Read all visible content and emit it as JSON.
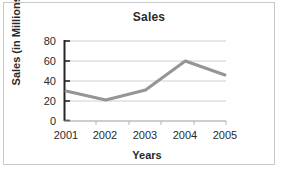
{
  "chart_data": {
    "type": "line",
    "title": "Sales",
    "xlabel": "Years",
    "ylabel": "Sales (in Millions)",
    "categories": [
      "2001",
      "2002",
      "2003",
      "2004",
      "2005"
    ],
    "values": [
      30,
      21,
      31,
      60,
      46
    ],
    "series": [
      {
        "name": "Sales",
        "values": [
          30,
          21,
          31,
          60,
          46
        ]
      }
    ],
    "ylim": [
      0,
      80
    ],
    "yticks": [
      0,
      20,
      40,
      60,
      80
    ],
    "ytick_labels": [
      "0",
      "20",
      "40",
      "60",
      "80"
    ],
    "grid": "horizontal",
    "legend": "none",
    "line_color": "#959595",
    "axis_color": "#262626",
    "gridline_color": "#cfcfcf",
    "plot_background": "#ffffff",
    "border_color": "#c8c8c8"
  }
}
